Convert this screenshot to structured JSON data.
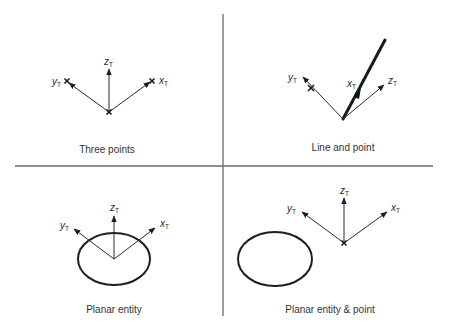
{
  "colors": {
    "line": "#2a2a2a",
    "divider": "#6a6a6a",
    "background": "#ffffff"
  },
  "axis_labels": {
    "x_base": "x",
    "y_base": "y",
    "z_base": "z",
    "subscript": "T"
  },
  "panels": [
    {
      "id": "three-points",
      "caption": "Three points",
      "features": [
        "point-origin",
        "point-x",
        "point-y"
      ]
    },
    {
      "id": "line-and-point",
      "caption": "Line and point",
      "features": [
        "line",
        "point-on-y"
      ]
    },
    {
      "id": "planar-entity",
      "caption": "Planar entity",
      "features": [
        "ellipse"
      ]
    },
    {
      "id": "planar-entity-point",
      "caption": "Planar entity & point",
      "features": [
        "ellipse",
        "point-origin"
      ]
    }
  ]
}
